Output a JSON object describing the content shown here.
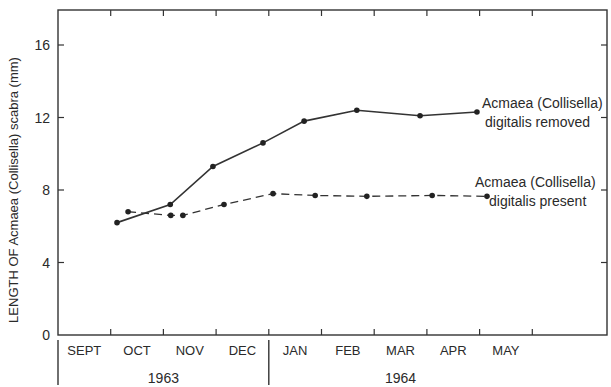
{
  "chart_data": {
    "type": "line",
    "title": "",
    "ylabel": "LENGTH OF Acmaea (Collisella) scabra (mm)",
    "xlabel": "",
    "ylim": [
      0,
      17.9
    ],
    "xlim": [
      0,
      10.4
    ],
    "yticks": [
      0,
      4,
      8,
      12,
      16
    ],
    "ytick_labels": [
      "0",
      "4",
      "8",
      "12",
      "16"
    ],
    "month_labels": [
      "SEPT",
      "OCT",
      "NOV",
      "DEC",
      "JAN",
      "FEB",
      "MAR",
      "APR",
      "MAY"
    ],
    "month_boundaries": [
      1,
      2,
      3,
      4,
      5,
      6,
      7,
      8,
      9
    ],
    "year_groups": [
      {
        "label": "1963",
        "start": 0,
        "end": 4
      },
      {
        "label": "1964",
        "start": 4,
        "end": 9
      }
    ],
    "x_unit": "months since start of September 1963",
    "grid": false,
    "series": [
      {
        "name": "Acmaea (Collisella) digitalis removed",
        "label_lines": [
          "Acmaea (Collisella)",
          "digitalis removed"
        ],
        "style": "solid",
        "x": [
          1.12,
          2.13,
          2.94,
          3.89,
          4.67,
          5.67,
          6.87,
          7.95
        ],
        "values": [
          6.2,
          7.2,
          9.3,
          10.6,
          11.8,
          12.4,
          12.1,
          12.3
        ]
      },
      {
        "name": "Acmaea (Collisella) digitalis present",
        "label_lines": [
          "Acmaea (Collisella)",
          "digitalis present"
        ],
        "style": "dashed",
        "x": [
          1.33,
          2.14,
          2.37,
          3.15,
          4.08,
          4.88,
          5.86,
          7.1,
          8.14
        ],
        "values": [
          6.8,
          6.6,
          6.6,
          7.2,
          7.8,
          7.7,
          7.65,
          7.7,
          7.65
        ]
      }
    ]
  }
}
